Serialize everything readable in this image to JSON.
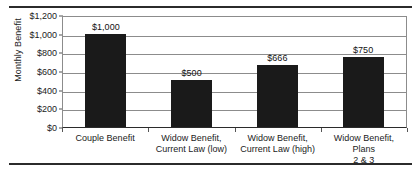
{
  "chart_data": {
    "type": "bar",
    "title": "",
    "xlabel": "",
    "ylabel": "Monthly Benefit",
    "ylim": [
      0,
      1200
    ],
    "ytick_step": 200,
    "grid": true,
    "legend": false,
    "bar_color": "#1a1a1a",
    "categories": [
      "Couple Benefit",
      "Widow Benefit, Current Law (low)",
      "Widow Benefit, Current Law (high)",
      "Widow Benefit, Plans 2 & 3"
    ],
    "category_lines": [
      [
        "Couple Benefit"
      ],
      [
        "Widow Benefit,",
        "Current Law (low)"
      ],
      [
        "Widow Benefit,",
        "Current Law (high)"
      ],
      [
        "Widow Benefit, Plans",
        "2 & 3"
      ]
    ],
    "values": [
      1000,
      500,
      666,
      750
    ],
    "data_labels": [
      "$1,000",
      "$500",
      "$666",
      "$750"
    ],
    "ytick_labels": [
      "$1,200",
      "$1,000",
      "$800",
      "$600",
      "$400",
      "$200",
      "$0"
    ],
    "ytick_values": [
      1200,
      1000,
      800,
      600,
      400,
      200,
      0
    ]
  }
}
